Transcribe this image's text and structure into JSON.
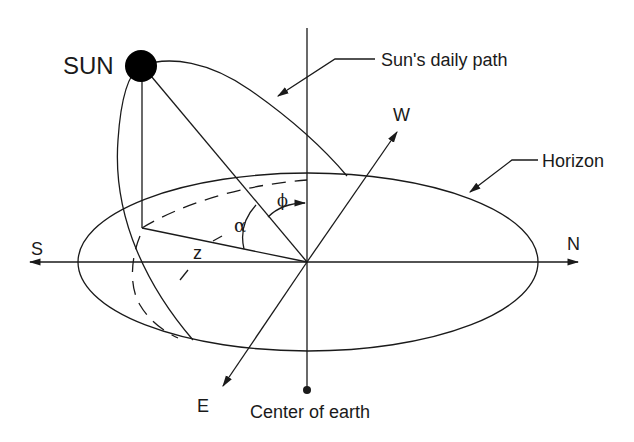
{
  "diagram": {
    "labels": {
      "sun": "SUN",
      "sun_path": "Sun's daily path",
      "horizon": "Horizon",
      "north": "N",
      "south": "S",
      "east": "E",
      "west": "W",
      "center_of_earth": "Center of earth",
      "altitude_angle": "α",
      "azimuth_angle": "ϕ",
      "zenith_angle": "z"
    },
    "colors": {
      "stroke": "#1a1a1a",
      "background": "#ffffff",
      "sun_fill": "#000000"
    }
  }
}
